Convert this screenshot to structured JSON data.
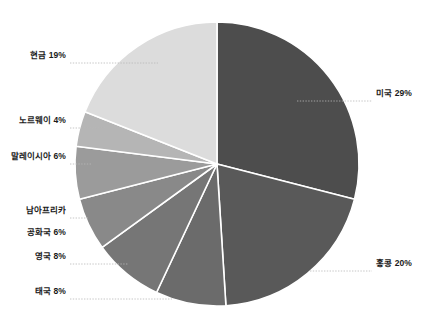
{
  "chart_data": {
    "type": "pie",
    "title": "",
    "subtitle": "",
    "xlabel": "",
    "ylabel": "",
    "legend_position": "none",
    "grid": false,
    "start_angle_deg": 0,
    "direction": "clockwise",
    "units": "percent",
    "total": 100,
    "categories": [
      "미국",
      "홍콩",
      "태국",
      "영국",
      "남아프리카 공화국",
      "말레이시아",
      "노르웨이",
      "현금"
    ],
    "values": [
      29,
      20,
      8,
      8,
      6,
      6,
      4,
      19
    ],
    "slices": [
      {
        "name": "미국",
        "label": "미국 29%",
        "value": 29,
        "color": "#4d4d4d",
        "label_side": "right",
        "label_lines": [
          "미국 29%"
        ]
      },
      {
        "name": "홍콩",
        "label": "홍콩 20%",
        "value": 20,
        "color": "#595959",
        "label_side": "right",
        "label_lines": [
          "홍콩 20%"
        ]
      },
      {
        "name": "태국",
        "label": "태국 8%",
        "value": 8,
        "color": "#6b6b6b",
        "label_side": "left",
        "label_lines": [
          "태국 8%"
        ]
      },
      {
        "name": "영국",
        "label": "영국 8%",
        "value": 8,
        "color": "#767676",
        "label_side": "left",
        "label_lines": [
          "영국 8%"
        ]
      },
      {
        "name": "남아프리카 공화국",
        "label": "남아프리카\n공화국 6%",
        "value": 6,
        "color": "#898989",
        "label_side": "left",
        "label_lines": [
          "남아프리카",
          "공화국 6%"
        ]
      },
      {
        "name": "말레이시아",
        "label": "말레이시아 6%",
        "value": 6,
        "color": "#9b9b9b",
        "label_side": "left",
        "label_lines": [
          "말레이시아 6%"
        ]
      },
      {
        "name": "노르웨이",
        "label": "노르웨이 4%",
        "value": 4,
        "color": "#b5b5b5",
        "label_side": "left",
        "label_lines": [
          "노르웨이 4%"
        ]
      },
      {
        "name": "현금",
        "label": "현금 19%",
        "value": 19,
        "color": "#dcdcdc",
        "label_side": "left",
        "label_lines": [
          "현금 19%"
        ]
      }
    ],
    "style": {
      "background": "#ffffff",
      "slice_separator_color": "#ffffff",
      "leader_line_color": "#b0b0b0",
      "label_color": "#1a1a1a",
      "center_x": 217,
      "center_y": 164,
      "radius": 142
    }
  },
  "labels": {
    "cash": "현금 19%",
    "norway": "노르웨이 4%",
    "malaysia": "말레이시아 6%",
    "south_africa_line1": "남아프리카",
    "south_africa_line2": "공화국 6%",
    "uk": "영국 8%",
    "thailand": "태국 8%",
    "usa": "미국 29%",
    "hongkong": "홍콩 20%"
  }
}
